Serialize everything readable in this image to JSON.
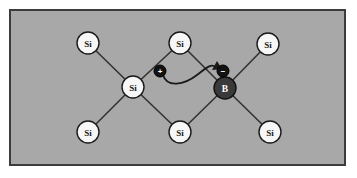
{
  "figure": {
    "canvas": {
      "width": 357,
      "height": 178
    },
    "panel": {
      "name": "lattice-panel",
      "x": 9,
      "y": 9,
      "width": 337,
      "height": 157,
      "fill_color": "#a8a8a8",
      "border_color": "#3c3c3c",
      "border_width": 2
    },
    "colors": {
      "background": "#ffffff",
      "lattice_fill": "#a8a8a8",
      "bond": "#333333",
      "si_fill": "#f7f7f7",
      "si_stroke": "#1a1a1a",
      "si_text": "#1a1a1a",
      "dopant_fill": "#3a3a3a",
      "dopant_stroke": "#111111",
      "dopant_text": "#ffffff",
      "charge_fill": "#121212",
      "charge_stroke": "#000000",
      "charge_text": "#ffffff",
      "arrow": "#1a1a1a"
    }
  },
  "atoms": [
    {
      "id": "si-top-left",
      "label": "Si",
      "kind": "silicon",
      "x": 88,
      "y": 43,
      "r": 11
    },
    {
      "id": "si-top-middle",
      "label": "Si",
      "kind": "silicon",
      "x": 180,
      "y": 43,
      "r": 11
    },
    {
      "id": "si-top-right",
      "label": "Si",
      "kind": "silicon",
      "x": 268,
      "y": 44,
      "r": 11
    },
    {
      "id": "si-center",
      "label": "Si",
      "kind": "silicon",
      "x": 133,
      "y": 87,
      "r": 11
    },
    {
      "id": "b-dopant",
      "label": "B",
      "kind": "boron",
      "x": 225,
      "y": 88,
      "r": 11
    },
    {
      "id": "si-bottom-left",
      "label": "Si",
      "kind": "silicon",
      "x": 88,
      "y": 132,
      "r": 11
    },
    {
      "id": "si-bottom-middle",
      "label": "Si",
      "kind": "silicon",
      "x": 180,
      "y": 132,
      "r": 11
    },
    {
      "id": "si-bottom-right",
      "label": "Si",
      "kind": "silicon",
      "x": 270,
      "y": 132,
      "r": 11
    }
  ],
  "bonds": [
    {
      "id": "bond-center-topleft",
      "from": "si-center",
      "to": "si-top-left"
    },
    {
      "id": "bond-center-topmiddle",
      "from": "si-center",
      "to": "si-top-middle"
    },
    {
      "id": "bond-center-bottomleft",
      "from": "si-center",
      "to": "si-bottom-left"
    },
    {
      "id": "bond-center-bottommiddle",
      "from": "si-center",
      "to": "si-bottom-middle"
    },
    {
      "id": "bond-boron-topmiddle",
      "from": "b-dopant",
      "to": "si-top-middle"
    },
    {
      "id": "bond-boron-topright",
      "from": "b-dopant",
      "to": "si-top-right"
    },
    {
      "id": "bond-boron-bottommiddle",
      "from": "b-dopant",
      "to": "si-bottom-middle"
    },
    {
      "id": "bond-boron-bottomright",
      "from": "b-dopant",
      "to": "si-bottom-right"
    }
  ],
  "charges": [
    {
      "id": "hole-charge",
      "symbol": "+",
      "x": 160,
      "y": 71,
      "r": 6
    },
    {
      "id": "acceptor-charge",
      "symbol": "−",
      "x": 223,
      "y": 71,
      "r": 6
    }
  ],
  "arrow": {
    "id": "hole-motion-arrow",
    "path": "M 163 75 C 166 86, 182 84, 196 75 C 206 68, 212 64, 216 67",
    "head_points": "216,63 222,68 214,71",
    "stroke_width": 2
  }
}
